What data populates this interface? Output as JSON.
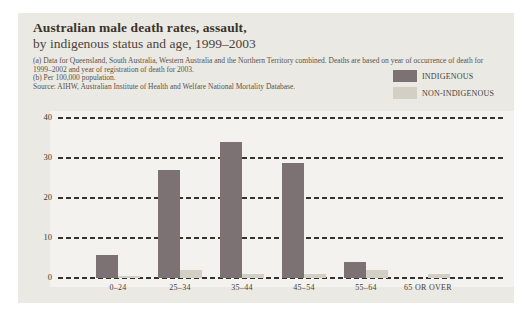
{
  "figure": {
    "title": "Australian male death rates, assault,",
    "subtitle": "by indigenous status and age, 1999–2003",
    "notes": {
      "note_a": "(a) Data for Queensland, South Australia, Western Australia and the Northern Territory combined. Deaths are based on year of occurrence of death for 1999–2002 and year of registration of death for 2003.",
      "note_b": "(b) Per 100,000 population.",
      "source": "Source: AIHW, Australian Institute of Health and Welfare National Mortality Database."
    },
    "panel_background": "#ebe9e4"
  },
  "legend": {
    "position": "top-right",
    "items": [
      {
        "label": "INDIGENOUS",
        "color": "#7c7173"
      },
      {
        "label": "NON-INDIGENOUS",
        "color": "#d2cfc4"
      }
    ]
  },
  "chart_data": {
    "type": "bar",
    "title": "Australian male death rates, assault, by indigenous status and age, 1999–2003",
    "categories": [
      "0–24",
      "25–34",
      "35–44",
      "45–54",
      "55–64",
      "65 OR OVER"
    ],
    "series": [
      {
        "name": "INDIGENOUS",
        "color": "#7c7173",
        "values": [
          5.8,
          27,
          34,
          28.8,
          4,
          0
        ]
      },
      {
        "name": "NON-INDIGENOUS",
        "color": "#d2cfc4",
        "values": [
          0.6,
          1.9,
          1.1,
          0.9,
          1.9,
          1.1
        ]
      }
    ],
    "xlabel": "",
    "ylabel": "",
    "ylim": [
      0,
      40
    ],
    "yticks": [
      0,
      10,
      20,
      30,
      40
    ],
    "grid": "horizontal-dashed",
    "gridline_color": "#33312c",
    "legend_position": "top-right"
  }
}
